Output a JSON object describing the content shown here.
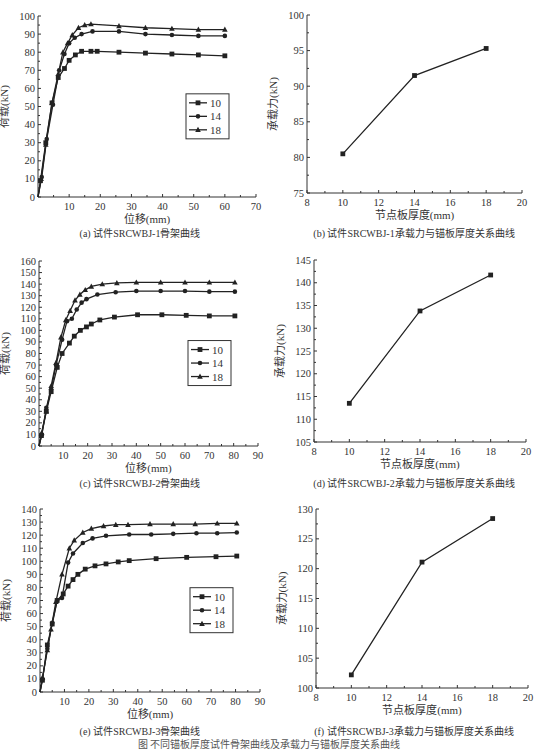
{
  "figure_caption": "图  不同锚板厚度试件骨架曲线及承载力与锚板厚度关系曲线",
  "chart_data": [
    {
      "id": "a",
      "type": "line",
      "caption": "(a) 试件SRCWBJ-1骨架曲线",
      "xlabel": "位移(mm)",
      "ylabel": "荷载(kN)",
      "xlim": [
        0,
        70
      ],
      "ylim": [
        0,
        100
      ],
      "xticks": [
        10,
        20,
        30,
        40,
        50,
        60,
        70
      ],
      "yticks": [
        0,
        10,
        20,
        30,
        40,
        50,
        60,
        70,
        80,
        90,
        100
      ],
      "legend": "right-middle",
      "series": [
        {
          "name": "10",
          "marker": "square",
          "x": [
            0,
            0.8,
            2.5,
            4.5,
            6.5,
            8.5,
            10,
            12,
            14,
            17,
            19,
            26,
            34.5,
            43,
            51.5,
            60
          ],
          "y": [
            0,
            9,
            30,
            52,
            66,
            71,
            75.5,
            78.5,
            80.5,
            80.5,
            80.5,
            80,
            79.5,
            79,
            78.5,
            78
          ]
        },
        {
          "name": "14",
          "marker": "circle",
          "x": [
            0,
            1.2,
            2.8,
            4.8,
            6.8,
            8.5,
            10,
            11.8,
            14,
            17.5,
            26,
            34.5,
            43,
            51.5,
            60
          ],
          "y": [
            0,
            11,
            32,
            51,
            70,
            79,
            85,
            88,
            90,
            91.5,
            91.5,
            90,
            89.5,
            89,
            89
          ]
        },
        {
          "name": "18",
          "marker": "triangle",
          "x": [
            0,
            1,
            2.5,
            4.5,
            6.5,
            8,
            9.5,
            11,
            13,
            15,
            17,
            26,
            34.5,
            43,
            51.5,
            60
          ],
          "y": [
            0,
            10,
            29,
            52,
            68,
            80,
            85,
            89.5,
            93.5,
            95,
            95.5,
            94.5,
            93.5,
            93,
            92.5,
            92.5
          ]
        }
      ]
    },
    {
      "id": "b",
      "type": "line",
      "caption": "(b) 试件SRCWBJ-1承载力与锚板厚度关系曲线",
      "xlabel": "节点板厚度(mm)",
      "ylabel": "承载力(kN)",
      "xlim": [
        8,
        20
      ],
      "ylim": [
        75,
        100
      ],
      "xticks": [
        8,
        10,
        12,
        14,
        16,
        18,
        20
      ],
      "yticks": [
        75,
        80,
        85,
        90,
        95,
        100
      ],
      "series": [
        {
          "name": "承载力",
          "marker": "square",
          "x": [
            10,
            14,
            18
          ],
          "y": [
            80.5,
            91.5,
            95.3
          ]
        }
      ]
    },
    {
      "id": "c",
      "type": "line",
      "caption": "(c) 试件SRCWBJ-2骨架曲线",
      "xlabel": "位移(mm)",
      "ylabel": "荷载(kN)",
      "xlim": [
        0,
        90
      ],
      "ylim": [
        0,
        160
      ],
      "xticks": [
        10,
        20,
        30,
        40,
        50,
        60,
        70,
        80,
        90
      ],
      "yticks": [
        0,
        10,
        20,
        30,
        40,
        50,
        60,
        70,
        80,
        90,
        100,
        110,
        120,
        130,
        140,
        150,
        160
      ],
      "legend": "right-middle",
      "series": [
        {
          "name": "10",
          "marker": "square",
          "x": [
            0,
            1,
            3,
            5,
            7.5,
            9.5,
            12.5,
            14.5,
            17,
            19.5,
            21.5,
            25,
            31,
            40.5,
            50.5,
            60.5,
            70,
            80.5
          ],
          "y": [
            0,
            9,
            30,
            47,
            68,
            80,
            89,
            95,
            100,
            103,
            105.5,
            109,
            111.5,
            113.5,
            113.5,
            113,
            112.5,
            112.5
          ]
        },
        {
          "name": "14",
          "marker": "circle",
          "x": [
            0,
            1.2,
            3,
            5,
            7,
            9.5,
            11.5,
            13.5,
            15.5,
            17.5,
            19.5,
            24,
            31.5,
            40,
            50,
            60,
            70,
            80.5
          ],
          "y": [
            0,
            10,
            33,
            49,
            70,
            92,
            108,
            110,
            118,
            124,
            127,
            131,
            133,
            134,
            134,
            134,
            133.5,
            133.5
          ]
        },
        {
          "name": "18",
          "marker": "triangle",
          "x": [
            0,
            1,
            3,
            5,
            7,
            9,
            11,
            12.8,
            14.8,
            16.8,
            19,
            21.5,
            26,
            32,
            40,
            50,
            60,
            70,
            80.5
          ],
          "y": [
            0,
            11,
            30,
            52,
            72,
            94,
            109,
            117,
            126,
            131,
            135,
            138,
            140,
            141,
            141.5,
            141.5,
            141.5,
            141.5,
            141.5
          ]
        }
      ]
    },
    {
      "id": "d",
      "type": "line",
      "caption": "(d) 试件SRCWBJ-2承载力与锚板厚度关系曲线",
      "xlabel": "节点板厚度(mm)",
      "ylabel": "承载力(kN)",
      "xlim": [
        8,
        20
      ],
      "ylim": [
        105,
        145
      ],
      "xticks": [
        8,
        10,
        12,
        14,
        16,
        18,
        20
      ],
      "yticks": [
        105,
        110,
        115,
        120,
        125,
        130,
        135,
        140,
        145
      ],
      "series": [
        {
          "name": "承载力",
          "marker": "square",
          "x": [
            10,
            14,
            18
          ],
          "y": [
            113.5,
            133.8,
            141.7
          ]
        }
      ]
    },
    {
      "id": "e",
      "type": "line",
      "caption": "(e) 试件SRCWBJ-3骨架曲线",
      "xlabel": "位移(mm)",
      "ylabel": "荷载(kN)",
      "xlim": [
        0,
        90
      ],
      "ylim": [
        0,
        140
      ],
      "xticks": [
        10,
        20,
        30,
        40,
        50,
        60,
        70,
        80,
        90
      ],
      "yticks": [
        0,
        10,
        20,
        30,
        40,
        50,
        60,
        70,
        80,
        90,
        100,
        110,
        120,
        130,
        140
      ],
      "legend": "right-middle",
      "series": [
        {
          "name": "10",
          "marker": "square",
          "x": [
            0,
            1,
            3,
            5,
            7,
            9.5,
            11.5,
            13.5,
            15.5,
            18.5,
            22.5,
            27,
            32,
            36.5,
            47.5,
            60,
            72,
            80.5
          ],
          "y": [
            0,
            9,
            36,
            52,
            70,
            75,
            81,
            86,
            90,
            94,
            96.5,
            98,
            99.5,
            100.5,
            102,
            103,
            103.5,
            104
          ]
        },
        {
          "name": "14",
          "marker": "circle",
          "x": [
            0,
            1,
            3,
            5,
            7,
            9,
            11.5,
            13.5,
            17.5,
            21.5,
            27,
            36.5,
            45.5,
            54.5,
            64,
            72.5,
            80.5
          ],
          "y": [
            0,
            10,
            33,
            53,
            70,
            72,
            99,
            106,
            114,
            117.5,
            119.5,
            120.5,
            120.5,
            121,
            121.5,
            121.5,
            122
          ]
        },
        {
          "name": "18",
          "marker": "triangle",
          "x": [
            0,
            1,
            3,
            4.5,
            6.5,
            9,
            12,
            14,
            17.5,
            21,
            26,
            31,
            36,
            45,
            54.5,
            63.5,
            72.5,
            80.5
          ],
          "y": [
            0,
            11,
            32,
            48,
            69,
            90,
            110,
            116,
            122,
            125,
            127,
            128,
            128,
            128.5,
            128.5,
            128.5,
            129,
            129
          ]
        }
      ]
    },
    {
      "id": "f",
      "type": "line",
      "caption": "(f) 试件SRCWBJ-3承载力与锚板厚度关系曲线",
      "xlabel": "节点板厚度(mm)",
      "ylabel": "承载力(kN)",
      "xlim": [
        8,
        20
      ],
      "ylim": [
        100,
        130
      ],
      "xticks": [
        8,
        10,
        12,
        14,
        16,
        18,
        20
      ],
      "yticks": [
        100,
        105,
        110,
        115,
        120,
        125,
        130
      ],
      "series": [
        {
          "name": "承载力",
          "marker": "square",
          "x": [
            10,
            14,
            18
          ],
          "y": [
            102.2,
            121.1,
            128.4
          ]
        }
      ]
    }
  ]
}
